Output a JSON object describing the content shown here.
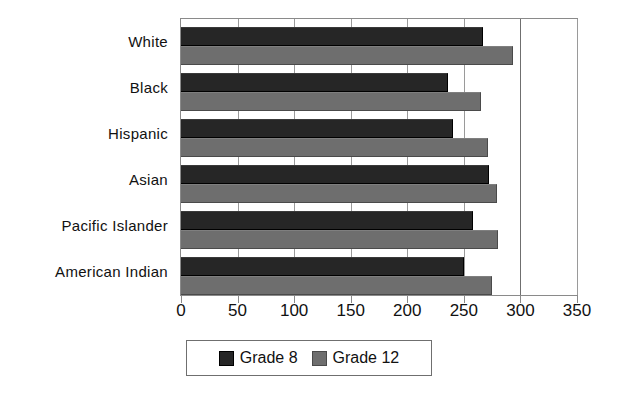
{
  "chart_data": {
    "type": "bar",
    "orientation": "horizontal",
    "title": "",
    "subtitle": "",
    "xlabel": "",
    "ylabel": "",
    "categories": [
      "White",
      "Black",
      "Hispanic",
      "Asian",
      "Pacific Islander",
      "American Indian"
    ],
    "series": [
      {
        "name": "Grade 8",
        "values": [
          267,
          236,
          240,
          272,
          258,
          250
        ],
        "color": "#262626"
      },
      {
        "name": "Grade 12",
        "values": [
          293,
          265,
          271,
          279,
          280,
          275
        ],
        "color": "#6e6e6e"
      }
    ],
    "xlim": [
      0,
      350
    ],
    "xticks": [
      0,
      50,
      100,
      150,
      200,
      250,
      300,
      350
    ],
    "xtick_labels": [
      "0",
      "50",
      "100",
      "150",
      "200",
      "250",
      "300",
      "350"
    ],
    "grid": true,
    "grid_axis": "x",
    "legend": {
      "position": "bottom",
      "entries": [
        {
          "label": "Grade 8",
          "color": "#262626"
        },
        {
          "label": "Grade 12",
          "color": "#6e6e6e"
        }
      ]
    },
    "frame_color": "#8a8a8a",
    "background": "#ffffff"
  }
}
